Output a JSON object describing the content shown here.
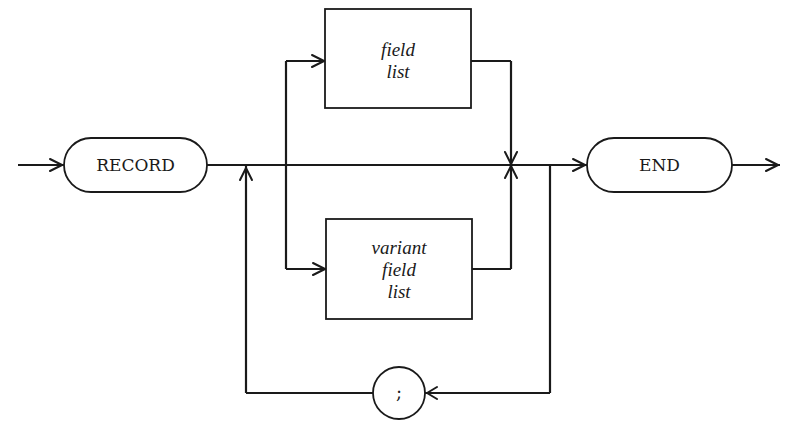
{
  "diagram": {
    "type": "syntax-diagram",
    "terminals": {
      "record": "RECORD",
      "end": "END",
      "separator": ";"
    },
    "nonterminals": {
      "field_list": {
        "line1": "field",
        "line2": "list"
      },
      "variant_field_list": {
        "line1": "variant",
        "line2": "field",
        "line3": "list"
      }
    },
    "flow": [
      "entry -> RECORD",
      "RECORD -> (field list | variant field list)",
      "(field list | variant field list) -> END",
      "repeat: ; -> back to branch",
      "END -> exit"
    ],
    "colors": {
      "stroke": "#1a1a1a",
      "background": "#ffffff"
    }
  }
}
